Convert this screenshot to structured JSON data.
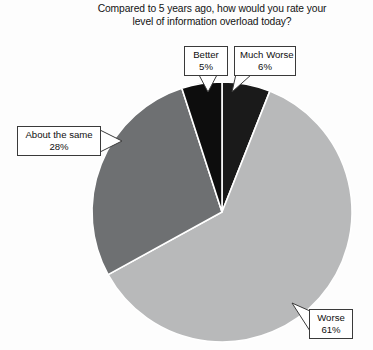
{
  "chart_data": {
    "type": "pie",
    "title": "Compared to 5 years ago, how would you rate your\nlevel of information overload today?",
    "xlabel": "",
    "ylabel": "",
    "legend_position": "none",
    "grid": false,
    "categories": [
      "Much Worse",
      "Worse",
      "About the same",
      "Better"
    ],
    "values": [
      6,
      61,
      28,
      5
    ],
    "unit": "%",
    "start_angle_deg": 0,
    "direction": "clockwise",
    "slices": [
      {
        "label": "Much Worse",
        "value": 6,
        "display": "6%",
        "color": "#1a1a1a"
      },
      {
        "label": "Worse",
        "value": 61,
        "display": "61%",
        "color": "#b8b9ba"
      },
      {
        "label": "About the same",
        "value": 28,
        "display": "28%",
        "color": "#6e7072"
      },
      {
        "label": "Better",
        "value": 5,
        "display": "5%",
        "color": "#0d0d0d"
      }
    ]
  },
  "title": {
    "text": "Compared to 5 years ago, how would you rate your\nlevel of information overload today?"
  },
  "labels": {
    "better": {
      "name": "Better",
      "value": "5%"
    },
    "much_worse": {
      "name": "Much Worse",
      "value": "6%"
    },
    "about_same": {
      "name": "About the same",
      "value": "28%"
    },
    "worse": {
      "name": "Worse",
      "value": "61%"
    }
  },
  "colors": {
    "background": "#fdfdfd",
    "slice_better": "#0d0d0d",
    "slice_much_worse": "#1a1a1a",
    "slice_worse": "#b8b9ba",
    "slice_about_same": "#6e7072",
    "slice_outline": "#ffffff",
    "callout_border": "#3a3a3a",
    "text": "#131313"
  },
  "geometry": {
    "center_x": 222,
    "center_y": 212,
    "radius": 130
  }
}
